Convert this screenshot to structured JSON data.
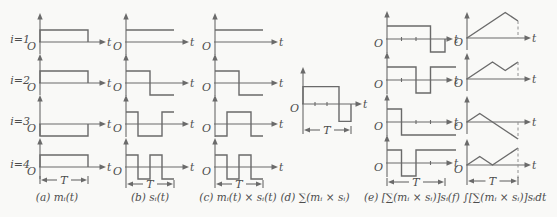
{
  "figure": {
    "row_labels": [
      "i=1",
      "i=2",
      "i=3",
      "i=4"
    ],
    "labels": {
      "origin": "O",
      "time_axis": "t",
      "period": "T"
    },
    "columns": [
      {
        "key": "a",
        "caption": "(a) mᵢ(t)"
      },
      {
        "key": "b",
        "caption": "(b) sᵢ(t)"
      },
      {
        "key": "c",
        "caption": "(c) mᵢ(t) × sᵢ(t)"
      },
      {
        "key": "d",
        "caption": "(d) ∑(mᵢ × sᵢ)"
      },
      {
        "key": "e",
        "caption": "(e) [∑(mᵢ × sᵢ)]sᵢ"
      },
      {
        "key": "f",
        "caption": "(f) ∫[∑(mᵢ × sᵢ)]sᵢdt"
      }
    ]
  },
  "colors": {
    "background": "#f9f9f7",
    "line": "#6a6a6a",
    "text": "#4c4c4c",
    "dashed": "#909090"
  },
  "chart_data": {
    "type": "line",
    "title": "",
    "x_axis": "t, shown from 0 to T (T marked with span arrows)",
    "y_axis": "amplitude; steps in units of 1 (panels a-c) and 2 (panels d-e); panel f integral values in units of T",
    "grid": false,
    "panels": [
      {
        "id": "a1",
        "column": "a",
        "row": 1,
        "signal": "m1(t)",
        "waveform": "step",
        "chips": [
          1
        ]
      },
      {
        "id": "a2",
        "column": "a",
        "row": 2,
        "signal": "m2(t)",
        "waveform": "step",
        "chips": [
          1
        ]
      },
      {
        "id": "a3",
        "column": "a",
        "row": 3,
        "signal": "m3(t)",
        "waveform": "step",
        "chips": [
          -1
        ]
      },
      {
        "id": "a4",
        "column": "a",
        "row": 4,
        "signal": "m4(t)",
        "waveform": "step",
        "chips": [
          1
        ]
      },
      {
        "id": "b1",
        "column": "b",
        "row": 1,
        "signal": "s1(t)",
        "waveform": "step",
        "chips": [
          1,
          1,
          1,
          1
        ]
      },
      {
        "id": "b2",
        "column": "b",
        "row": 2,
        "signal": "s2(t)",
        "waveform": "step",
        "chips": [
          1,
          1,
          -1,
          -1
        ]
      },
      {
        "id": "b3",
        "column": "b",
        "row": 3,
        "signal": "s3(t)",
        "waveform": "step",
        "chips": [
          1,
          -1,
          -1,
          1
        ]
      },
      {
        "id": "b4",
        "column": "b",
        "row": 4,
        "signal": "s4(t)",
        "waveform": "step",
        "chips": [
          1,
          -1,
          1,
          -1
        ]
      },
      {
        "id": "c1",
        "column": "c",
        "row": 1,
        "signal": "m1(t)×s1(t)",
        "waveform": "step",
        "chips": [
          1,
          1,
          1,
          1
        ]
      },
      {
        "id": "c2",
        "column": "c",
        "row": 2,
        "signal": "m2(t)×s2(t)",
        "waveform": "step",
        "chips": [
          1,
          1,
          -1,
          -1
        ]
      },
      {
        "id": "c3",
        "column": "c",
        "row": 3,
        "signal": "m3(t)×s3(t)",
        "waveform": "step",
        "chips": [
          -1,
          1,
          1,
          -1
        ]
      },
      {
        "id": "c4",
        "column": "c",
        "row": 4,
        "signal": "m4(t)×s4(t)",
        "waveform": "step",
        "chips": [
          1,
          -1,
          1,
          -1
        ]
      },
      {
        "id": "d1",
        "column": "d",
        "row": 1,
        "signal": "∑(mᵢ×sᵢ)",
        "waveform": "step",
        "chips": [
          2,
          2,
          2,
          -2
        ]
      },
      {
        "id": "e1",
        "column": "e",
        "row": 1,
        "signal": "[∑]s1",
        "waveform": "step",
        "chips": [
          2,
          2,
          2,
          -2
        ]
      },
      {
        "id": "e2",
        "column": "e",
        "row": 2,
        "signal": "[∑]s2",
        "waveform": "step",
        "chips": [
          2,
          2,
          -2,
          2
        ]
      },
      {
        "id": "e3",
        "column": "e",
        "row": 3,
        "signal": "[∑]s3",
        "waveform": "step",
        "chips": [
          2,
          -2,
          -2,
          -2
        ]
      },
      {
        "id": "e4",
        "column": "e",
        "row": 4,
        "signal": "[∑]s4",
        "waveform": "step",
        "chips": [
          2,
          -2,
          2,
          2
        ]
      },
      {
        "id": "f1",
        "column": "f",
        "row": 1,
        "signal": "∫[∑]s1dt",
        "waveform": "line",
        "points": [
          [
            0,
            0
          ],
          [
            0.75,
            1.5
          ],
          [
            1,
            1
          ]
        ]
      },
      {
        "id": "f2",
        "column": "f",
        "row": 2,
        "signal": "∫[∑]s2dt",
        "waveform": "line",
        "points": [
          [
            0,
            0
          ],
          [
            0.5,
            1
          ],
          [
            0.75,
            0.5
          ],
          [
            1,
            1
          ]
        ]
      },
      {
        "id": "f3",
        "column": "f",
        "row": 3,
        "signal": "∫[∑]s3dt",
        "waveform": "line",
        "points": [
          [
            0,
            0
          ],
          [
            0.25,
            0.5
          ],
          [
            1,
            -1
          ]
        ]
      },
      {
        "id": "f4",
        "column": "f",
        "row": 4,
        "signal": "∫[∑]s4dt",
        "waveform": "line",
        "points": [
          [
            0,
            0
          ],
          [
            0.25,
            0.5
          ],
          [
            0.5,
            0
          ],
          [
            1,
            1
          ]
        ]
      }
    ]
  }
}
